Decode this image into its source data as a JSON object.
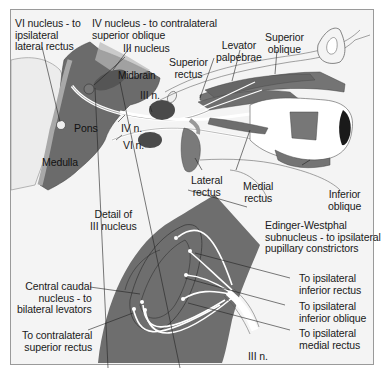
{
  "figure": {
    "colors": {
      "background": "#f4f4f4",
      "frame": "#9a9a9a",
      "brainstem": "#6b6b6b",
      "muscle": "#747474",
      "nucleus_field": "#6e6e6e",
      "nerve": "#ffffff",
      "leader_line": "#222222",
      "pupil": "#1a1a1a"
    },
    "labels": {
      "vi_nucleus": "VI nucleus - to\nipsilateral\nlateral rectus",
      "iv_nucleus": "IV nucleus - to contralateral\nsuperior oblique",
      "iii_nucleus": "III nucleus",
      "midbrain": "Midbrain",
      "pons": "Pons",
      "medulla": "Medulla",
      "iii_n_upper": "III n.",
      "iv_n": "IV n.",
      "vi_n": "VI n.",
      "superior_rectus": "Superior\nrectus",
      "levator_palpebrae": "Levator\npalpebrae",
      "superior_oblique": "Superior\noblique",
      "lateral_rectus": "Lateral\nrectus",
      "medial_rectus": "Medial\nrectus",
      "inferior_oblique": "Inferior\noblique",
      "detail_iii_nucleus": "Detail of\nIII nucleus",
      "edinger_westphal": "Edinger-Westphal\nsubnucleus - to ipsilateral\npupillary constrictors",
      "to_ipsi_inferior_rectus": "To ipsilateral\ninferior rectus",
      "to_ipsi_inferior_oblique": "To ipsilateral\ninferior oblique",
      "to_ipsi_medial_rectus": "To ipsilateral\nmedial rectus",
      "central_caudal": "Central caudal\nnucleus - to\nbilateral levators",
      "to_contra_superior_rectus": "To contralateral\nsuperior rectus",
      "iii_n_lower": "III n."
    }
  }
}
